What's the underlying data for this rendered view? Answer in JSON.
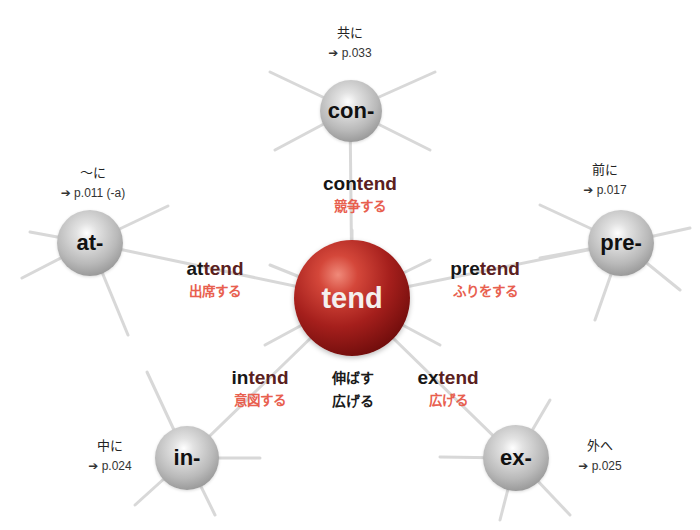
{
  "center": {
    "label": "tend",
    "meaning_line1": "伸ばす",
    "meaning_line2": "広げる"
  },
  "prefixes": [
    {
      "id": "con",
      "label": "con-",
      "meaning": "共に",
      "ref": "➔ p.033",
      "word_prefix": "con",
      "word_root": "tend",
      "word_meaning": "競争する"
    },
    {
      "id": "at",
      "label": "at-",
      "meaning": "～に",
      "ref": "➔ p.011 (-a)",
      "word_prefix": "at",
      "word_root": "tend",
      "word_meaning": "出席する"
    },
    {
      "id": "pre",
      "label": "pre-",
      "meaning": "前に",
      "ref": "➔ p.017",
      "word_prefix": "pre",
      "word_root": "tend",
      "word_meaning": "ふりをする"
    },
    {
      "id": "in",
      "label": "in-",
      "meaning": "中に",
      "ref": "➔ p.024",
      "word_prefix": "in",
      "word_root": "tend",
      "word_meaning": "意図する"
    },
    {
      "id": "ex",
      "label": "ex-",
      "meaning": "外へ",
      "ref": "➔ p.025",
      "word_prefix": "ex",
      "word_root": "tend",
      "word_meaning": "広げる"
    }
  ],
  "colors": {
    "center_sphere": "#8e1414",
    "prefix_sphere": "#b5b5b5",
    "root_text": "#5a2020",
    "japanese_meaning": "#e8604f"
  }
}
